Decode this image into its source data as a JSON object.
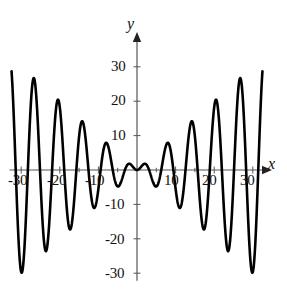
{
  "chart_data": {
    "type": "line",
    "title": "",
    "subtitle": "",
    "xlabel": "x",
    "ylabel": "y",
    "function": "y = x sin(x)",
    "xlim": [
      -32.5,
      32.5
    ],
    "ylim": [
      -31,
      31
    ],
    "grid": false,
    "legend": null,
    "legend_position": "none",
    "axis_style": "arrows-both-ends-positive",
    "line_color": "#000000",
    "line_width": 2.6,
    "xticks": [
      -30,
      -20,
      -10,
      10,
      20,
      30
    ],
    "xticklabels": [
      "-30",
      "-20",
      "-10",
      "10",
      "20",
      "30"
    ],
    "xtick_minor_step": 5,
    "yticks": [
      30,
      20,
      10,
      -10,
      -20,
      -30
    ],
    "yticklabels": [
      "30",
      "20",
      "10",
      "-10",
      "-20",
      "-30"
    ],
    "series": [
      {
        "name": "x sin(x)",
        "x": [
          -32.5,
          -32,
          -31.5,
          -31,
          -30.5,
          -30,
          -29.5,
          -29,
          -28.5,
          -28,
          -27.5,
          -27,
          -26.5,
          -26,
          -25.5,
          -25,
          -24.5,
          -24,
          -23.5,
          -23,
          -22.5,
          -22,
          -21.5,
          -21,
          -20.5,
          -20,
          -19.5,
          -19,
          -18.5,
          -18,
          -17.5,
          -17,
          -16.5,
          -16,
          -15.5,
          -15,
          -14.5,
          -14,
          -13.5,
          -13,
          -12.5,
          -12,
          -11.5,
          -11,
          -10.5,
          -10,
          -9.5,
          -9,
          -8.5,
          -8,
          -7.5,
          -7,
          -6.5,
          -6,
          -5.5,
          -5,
          -4.5,
          -4,
          -3.5,
          -3,
          -2.5,
          -2,
          -1.5,
          -1,
          -0.5,
          0,
          0.5,
          1,
          1.5,
          2,
          2.5,
          3,
          3.5,
          4,
          4.5,
          5,
          5.5,
          6,
          6.5,
          7,
          7.5,
          8,
          8.5,
          9,
          9.5,
          10,
          10.5,
          11,
          11.5,
          12,
          12.5,
          13,
          13.5,
          14,
          14.5,
          15,
          15.5,
          16,
          16.5,
          17,
          17.5,
          18,
          18.5,
          19,
          19.5,
          20,
          20.5,
          21,
          21.5,
          22,
          22.5,
          23,
          23.5,
          24,
          24.5,
          25,
          25.5,
          26,
          26.5,
          27,
          27.5,
          28,
          28.5,
          29,
          29.5,
          30,
          30.5,
          31,
          31.5,
          32,
          32.5
        ],
        "y": [
          -19.1,
          -17.3,
          -4.4,
          12.1,
          24.9,
          29.6,
          25.4,
          13.3,
          -3.2,
          -18.9,
          -27.4,
          -25.9,
          -14.9,
          1.4,
          16.3,
          23.5,
          21.3,
          10.8,
          -4.2,
          -17.2,
          -22.5,
          -17.8,
          -5.1,
          10.1,
          20.4,
          18.3,
          7.0,
          -7.8,
          -18.4,
          -17.6,
          -6.7,
          8.4,
          16.5,
          14.1,
          2.1,
          -11.0,
          -15.4,
          -9.8,
          2.1,
          11.7,
          12.3,
          6.4,
          -3.3,
          -11.0,
          -9.3,
          5.4,
          0.9,
          -3.7,
          -6.4,
          -7.9,
          -7.0,
          -4.6,
          -1.5,
          1.7,
          3.9,
          4.8,
          4.4,
          3.0,
          1.2,
          -0.4,
          -1.5,
          -1.8,
          -1.5,
          -0.8,
          -0.2,
          0.0,
          0.2,
          0.8,
          1.5,
          1.8,
          1.5,
          0.4,
          -1.2,
          -3.0,
          -4.4,
          -4.8,
          -3.9,
          -1.7,
          1.5,
          4.6,
          7.0,
          7.9,
          6.4,
          3.7,
          -0.9,
          -5.4,
          -9.3,
          -11.0,
          -3.3,
          6.4,
          12.3,
          11.7,
          2.1,
          -9.8,
          -15.4,
          -11.0,
          2.1,
          14.1,
          16.5,
          8.4,
          -6.7,
          -17.6,
          -18.4,
          -7.8,
          7.0,
          18.3,
          20.4,
          10.1,
          -5.1,
          -17.8,
          -22.5,
          -17.2,
          -4.2,
          10.8,
          21.3,
          23.5,
          16.3,
          1.4,
          -14.9,
          -25.9,
          -27.4,
          -18.9,
          -3.2,
          13.3,
          25.4,
          29.6,
          24.9,
          12.1,
          -4.4,
          -17.3,
          -19.1
        ]
      }
    ],
    "annotations": []
  },
  "labels": {
    "y_axis_name": "y",
    "x_axis_name": "x",
    "x_tick_neg30": "-30",
    "x_tick_neg20": "-20",
    "x_tick_neg10": "-10",
    "x_tick_10": "10",
    "x_tick_20": "20",
    "x_tick_30": "30",
    "y_tick_30": "30",
    "y_tick_20": "20",
    "y_tick_10": "10",
    "y_tick_neg10": "-10",
    "y_tick_neg20": "-20",
    "y_tick_neg30": "-30"
  }
}
